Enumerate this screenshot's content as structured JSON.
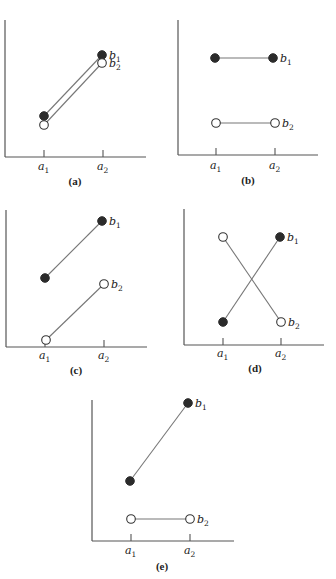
{
  "figure": {
    "legend": {
      "b1": {
        "label": "b",
        "sub": "1",
        "marker": "filled circle",
        "color": "#2b2b2b"
      },
      "b2": {
        "label": "b",
        "sub": "2",
        "marker": "open circle",
        "color": "#ffffff"
      }
    },
    "x_levels": [
      {
        "label": "a",
        "sub": "1"
      },
      {
        "label": "a",
        "sub": "2"
      }
    ],
    "panels": [
      {
        "id": "a",
        "caption": "(a)",
        "frame": {
          "yaxis_x": 5,
          "yaxis_top": 20,
          "xaxis_y": 157,
          "xaxis_right": 146,
          "tick_x": [
            44,
            103
          ],
          "tick_len": 7,
          "label_y": 170,
          "caption_x": 75,
          "caption_y": 185
        },
        "b1": {
          "points": [
            [
              44,
              116
            ],
            [
              102,
              55
            ]
          ]
        },
        "b2": {
          "points": [
            [
              44,
              125
            ],
            [
              102,
              63
            ]
          ]
        }
      },
      {
        "id": "b",
        "caption": "(b)",
        "frame": {
          "yaxis_x": 178,
          "yaxis_top": 20,
          "xaxis_y": 155,
          "xaxis_right": 318,
          "tick_x": [
            216,
            275
          ],
          "tick_len": 7,
          "label_y": 169,
          "caption_x": 248,
          "caption_y": 184
        },
        "b1": {
          "points": [
            [
              215,
              58
            ],
            [
              273,
              58
            ]
          ]
        },
        "b2": {
          "points": [
            [
              216,
              123
            ],
            [
              275,
              123
            ]
          ]
        }
      },
      {
        "id": "c",
        "caption": "(c)",
        "frame": {
          "yaxis_x": 6,
          "yaxis_top": 210,
          "xaxis_y": 347,
          "xaxis_right": 147,
          "tick_x": [
            45,
            104
          ],
          "tick_len": 7,
          "label_y": 359,
          "caption_x": 76,
          "caption_y": 374
        },
        "b1": {
          "points": [
            [
              45,
              278
            ],
            [
              102,
              221
            ]
          ]
        },
        "b2": {
          "points": [
            [
              46,
              340
            ],
            [
              104,
              284
            ]
          ]
        }
      },
      {
        "id": "d",
        "caption": "(d)",
        "frame": {
          "yaxis_x": 184,
          "yaxis_top": 209,
          "xaxis_y": 345,
          "xaxis_right": 324,
          "tick_x": [
            223,
            281
          ],
          "tick_len": 7,
          "label_y": 357,
          "caption_x": 255,
          "caption_y": 372
        },
        "b1": {
          "points": [
            [
              223,
              322
            ],
            [
              280,
              237
            ]
          ]
        },
        "b2": {
          "points": [
            [
              223,
              237
            ],
            [
              281,
              322
            ]
          ]
        }
      },
      {
        "id": "e",
        "caption": "(e)",
        "frame": {
          "yaxis_x": 92,
          "yaxis_top": 400,
          "xaxis_y": 541,
          "xaxis_right": 234,
          "tick_x": [
            131,
            190
          ],
          "tick_len": 7,
          "label_y": 554,
          "caption_x": 162,
          "caption_y": 570
        },
        "b1": {
          "points": [
            [
              130,
              481
            ],
            [
              188,
              403
            ]
          ]
        },
        "b2": {
          "points": [
            [
              131,
              519
            ],
            [
              190,
              519
            ]
          ]
        }
      }
    ]
  },
  "chart_data": [
    {
      "type": "line",
      "title": "(a)",
      "categories": [
        "a1",
        "a2"
      ],
      "series": [
        {
          "name": "b1",
          "values": [
            2.0,
            5.0
          ]
        },
        {
          "name": "b2",
          "values": [
            1.6,
            4.6
          ]
        }
      ],
      "xlabel": "",
      "ylabel": "",
      "grid": false,
      "legend_position": "inline-right"
    },
    {
      "type": "line",
      "title": "(b)",
      "categories": [
        "a1",
        "a2"
      ],
      "series": [
        {
          "name": "b1",
          "values": [
            4.5,
            4.5
          ]
        },
        {
          "name": "b2",
          "values": [
            1.5,
            1.5
          ]
        }
      ],
      "xlabel": "",
      "ylabel": "",
      "grid": false,
      "legend_position": "inline-right"
    },
    {
      "type": "line",
      "title": "(c)",
      "categories": [
        "a1",
        "a2"
      ],
      "series": [
        {
          "name": "b1",
          "values": [
            3.0,
            5.5
          ]
        },
        {
          "name": "b2",
          "values": [
            0.3,
            2.8
          ]
        }
      ],
      "xlabel": "",
      "ylabel": "",
      "grid": false,
      "legend_position": "inline-right"
    },
    {
      "type": "line",
      "title": "(d)",
      "categories": [
        "a1",
        "a2"
      ],
      "series": [
        {
          "name": "b1",
          "values": [
            1.0,
            5.0
          ]
        },
        {
          "name": "b2",
          "values": [
            5.0,
            1.0
          ]
        }
      ],
      "xlabel": "",
      "ylabel": "",
      "grid": false,
      "legend_position": "inline-right"
    },
    {
      "type": "line",
      "title": "(e)",
      "categories": [
        "a1",
        "a2"
      ],
      "series": [
        {
          "name": "b1",
          "values": [
            2.8,
            6.2
          ]
        },
        {
          "name": "b2",
          "values": [
            1.0,
            1.0
          ]
        }
      ],
      "xlabel": "",
      "ylabel": "",
      "grid": false,
      "legend_position": "inline-right"
    }
  ]
}
